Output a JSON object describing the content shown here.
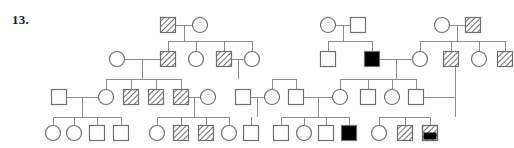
{
  "label": {
    "question_number": "13."
  },
  "legend": {
    "fill_types": [
      "unaffected",
      "hatched",
      "filled",
      "hatched-filled"
    ],
    "shapes": [
      "square",
      "circle"
    ],
    "shape_meaning": {
      "square": "male",
      "circle": "female"
    },
    "colors": {
      "stroke": "#6f6f6f",
      "line": "#8d8d8d",
      "filled": "#000000",
      "background": "#ffffff",
      "hatch": "#555555"
    }
  },
  "chart_data": {
    "type": "diagram",
    "diagram_type": "pedigree",
    "generations": 4,
    "symbol_size": 15,
    "generation_y": [
      25,
      59,
      97,
      133
    ],
    "individuals": [
      {
        "id": "I1",
        "gen": 1,
        "x": 168,
        "y": 25,
        "shape": "square",
        "fill": "hatched"
      },
      {
        "id": "I2",
        "gen": 1,
        "x": 200,
        "y": 25,
        "shape": "circle",
        "fill": "unaffected"
      },
      {
        "id": "I3",
        "gen": 1,
        "x": 328,
        "y": 25,
        "shape": "circle",
        "fill": "unaffected"
      },
      {
        "id": "I4",
        "gen": 1,
        "x": 358,
        "y": 25,
        "shape": "square",
        "fill": "unaffected"
      },
      {
        "id": "I5",
        "gen": 1,
        "x": 442,
        "y": 25,
        "shape": "circle",
        "fill": "unaffected"
      },
      {
        "id": "I6",
        "gen": 1,
        "x": 473,
        "y": 25,
        "shape": "square",
        "fill": "hatched"
      },
      {
        "id": "II1",
        "gen": 2,
        "x": 117,
        "y": 59,
        "shape": "circle",
        "fill": "unaffected"
      },
      {
        "id": "II2",
        "gen": 2,
        "x": 168,
        "y": 59,
        "shape": "square",
        "fill": "hatched"
      },
      {
        "id": "II3",
        "gen": 2,
        "x": 196,
        "y": 59,
        "shape": "circle",
        "fill": "unaffected"
      },
      {
        "id": "II4",
        "gen": 2,
        "x": 224,
        "y": 59,
        "shape": "square",
        "fill": "hatched"
      },
      {
        "id": "II5",
        "gen": 2,
        "x": 252,
        "y": 59,
        "shape": "circle",
        "fill": "unaffected"
      },
      {
        "id": "II6",
        "gen": 2,
        "x": 328,
        "y": 59,
        "shape": "square",
        "fill": "unaffected"
      },
      {
        "id": "II7",
        "gen": 2,
        "x": 372,
        "y": 59,
        "shape": "square",
        "fill": "filled"
      },
      {
        "id": "II8",
        "gen": 2,
        "x": 420,
        "y": 59,
        "shape": "circle",
        "fill": "unaffected"
      },
      {
        "id": "II9",
        "gen": 2,
        "x": 451,
        "y": 59,
        "shape": "square",
        "fill": "hatched"
      },
      {
        "id": "II10",
        "gen": 2,
        "x": 479,
        "y": 59,
        "shape": "circle",
        "fill": "unaffected"
      },
      {
        "id": "II11",
        "gen": 2,
        "x": 505,
        "y": 59,
        "shape": "square",
        "fill": "hatched"
      },
      {
        "id": "III1",
        "gen": 3,
        "x": 59,
        "y": 97,
        "shape": "square",
        "fill": "unaffected"
      },
      {
        "id": "III2",
        "gen": 3,
        "x": 106,
        "y": 97,
        "shape": "circle",
        "fill": "unaffected"
      },
      {
        "id": "III3",
        "gen": 3,
        "x": 131,
        "y": 97,
        "shape": "square",
        "fill": "hatched"
      },
      {
        "id": "III4",
        "gen": 3,
        "x": 156,
        "y": 97,
        "shape": "square",
        "fill": "hatched"
      },
      {
        "id": "III5",
        "gen": 3,
        "x": 181,
        "y": 97,
        "shape": "square",
        "fill": "hatched"
      },
      {
        "id": "III6",
        "gen": 3,
        "x": 208,
        "y": 97,
        "shape": "circle",
        "fill": "unaffected"
      },
      {
        "id": "III7",
        "gen": 3,
        "x": 243,
        "y": 97,
        "shape": "square",
        "fill": "unaffected"
      },
      {
        "id": "III8",
        "gen": 3,
        "x": 272,
        "y": 97,
        "shape": "circle",
        "fill": "unaffected"
      },
      {
        "id": "III9",
        "gen": 3,
        "x": 296,
        "y": 97,
        "shape": "square",
        "fill": "unaffected"
      },
      {
        "id": "III10",
        "gen": 3,
        "x": 340,
        "y": 97,
        "shape": "circle",
        "fill": "unaffected"
      },
      {
        "id": "III11",
        "gen": 3,
        "x": 368,
        "y": 97,
        "shape": "square",
        "fill": "unaffected"
      },
      {
        "id": "III12",
        "gen": 3,
        "x": 392,
        "y": 97,
        "shape": "circle",
        "fill": "unaffected"
      },
      {
        "id": "III13",
        "gen": 3,
        "x": 416,
        "y": 97,
        "shape": "square",
        "fill": "unaffected"
      },
      {
        "id": "IV1",
        "gen": 4,
        "x": 53,
        "y": 133,
        "shape": "circle",
        "fill": "unaffected"
      },
      {
        "id": "IV2",
        "gen": 4,
        "x": 74,
        "y": 133,
        "shape": "circle",
        "fill": "unaffected"
      },
      {
        "id": "IV3",
        "gen": 4,
        "x": 97,
        "y": 133,
        "shape": "square",
        "fill": "unaffected"
      },
      {
        "id": "IV4",
        "gen": 4,
        "x": 121,
        "y": 133,
        "shape": "square",
        "fill": "unaffected"
      },
      {
        "id": "IV5",
        "gen": 4,
        "x": 157,
        "y": 133,
        "shape": "circle",
        "fill": "unaffected"
      },
      {
        "id": "IV6",
        "gen": 4,
        "x": 181,
        "y": 133,
        "shape": "square",
        "fill": "hatched"
      },
      {
        "id": "IV7",
        "gen": 4,
        "x": 206,
        "y": 133,
        "shape": "square",
        "fill": "hatched"
      },
      {
        "id": "IV8",
        "gen": 4,
        "x": 229,
        "y": 133,
        "shape": "circle",
        "fill": "unaffected"
      },
      {
        "id": "IV9",
        "gen": 4,
        "x": 251,
        "y": 133,
        "shape": "square",
        "fill": "unaffected"
      },
      {
        "id": "IV10",
        "gen": 4,
        "x": 281,
        "y": 133,
        "shape": "square",
        "fill": "unaffected"
      },
      {
        "id": "IV11",
        "gen": 4,
        "x": 304,
        "y": 133,
        "shape": "circle",
        "fill": "unaffected"
      },
      {
        "id": "IV12",
        "gen": 4,
        "x": 326,
        "y": 133,
        "shape": "square",
        "fill": "unaffected"
      },
      {
        "id": "IV13",
        "gen": 4,
        "x": 349,
        "y": 133,
        "shape": "square",
        "fill": "filled"
      },
      {
        "id": "IV14",
        "gen": 4,
        "x": 379,
        "y": 133,
        "shape": "circle",
        "fill": "unaffected"
      },
      {
        "id": "IV15",
        "gen": 4,
        "x": 405,
        "y": 133,
        "shape": "square",
        "fill": "hatched"
      },
      {
        "id": "IV16",
        "gen": 4,
        "x": 430,
        "y": 133,
        "shape": "square",
        "fill": "hatched-filled"
      }
    ],
    "matings": [
      {
        "id": "M1",
        "partners": [
          "I1",
          "I2"
        ],
        "y": 25,
        "x1": 176,
        "x2": 192,
        "drop_x": 184,
        "sib_y": 41
      },
      {
        "id": "M2",
        "partners": [
          "I3",
          "I4"
        ],
        "y": 25,
        "x1": 336,
        "x2": 350,
        "drop_x": 343,
        "sib_y": 41
      },
      {
        "id": "M3",
        "partners": [
          "I5",
          "I6"
        ],
        "y": 25,
        "x1": 450,
        "x2": 465,
        "drop_x": 457,
        "sib_y": 41
      },
      {
        "id": "M4",
        "partners": [
          "II1",
          "II2"
        ],
        "y": 59,
        "x1": 125,
        "x2": 160,
        "drop_x": 142,
        "sib_y": 79
      },
      {
        "id": "M5",
        "partners": [
          "II4",
          "II5"
        ],
        "y": 59,
        "x1": 232,
        "x2": 244,
        "drop_x": 238,
        "sib_y": 79
      },
      {
        "id": "M6",
        "partners": [
          "II7",
          "II8"
        ],
        "y": 59,
        "x1": 380,
        "x2": 412,
        "drop_x": 396,
        "sib_y": 79
      },
      {
        "id": "M7",
        "partners": [
          "III1",
          "III2"
        ],
        "y": 97,
        "x1": 67,
        "x2": 98,
        "drop_x": 82,
        "sib_y": 117
      },
      {
        "id": "M8",
        "partners": [
          "III5",
          "III6"
        ],
        "y": 97,
        "x1": 189,
        "x2": 200,
        "drop_x": 194,
        "sib_y": 117
      },
      {
        "id": "M9",
        "partners": [
          "III7",
          "III8"
        ],
        "y": 97,
        "x1": 251,
        "x2": 264,
        "drop_x": 257,
        "sib_y": 117
      },
      {
        "id": "M10",
        "partners": [
          "III9",
          "III10"
        ],
        "y": 97,
        "x1": 304,
        "x2": 332,
        "drop_x": 318,
        "sib_y": 117
      },
      {
        "id": "M11",
        "partners": [
          "III13",
          "IV14"
        ],
        "y": 97,
        "x1": 424,
        "x2": 455,
        "drop_x": 455,
        "sib_y": 117
      }
    ],
    "sibships": [
      {
        "id": "S1",
        "parents": "M1",
        "sib_y": 41,
        "children": [
          "II2",
          "II3",
          "II4",
          "II5"
        ]
      },
      {
        "id": "S2",
        "parents": "M2",
        "sib_y": 41,
        "children": [
          "II6",
          "II7"
        ]
      },
      {
        "id": "S3",
        "parents": "M3",
        "sib_y": 41,
        "children": [
          "II8",
          "II9",
          "II10",
          "II11"
        ]
      },
      {
        "id": "S4",
        "parents": "M4",
        "sib_y": 79,
        "children": [
          "III2",
          "III3",
          "III4",
          "III5"
        ]
      },
      {
        "id": "S5",
        "parents": "M5",
        "sib_y": 79,
        "children": [
          "III8",
          "III9"
        ]
      },
      {
        "id": "S6",
        "parents": "M6",
        "sib_y": 79,
        "children": [
          "III10",
          "III11",
          "III12",
          "III13"
        ]
      },
      {
        "id": "S7",
        "parents": "M7",
        "sib_y": 117,
        "children": [
          "IV1",
          "IV2",
          "IV3",
          "IV4"
        ]
      },
      {
        "id": "S8",
        "parents": "M8",
        "sib_y": 117,
        "children": [
          "IV5",
          "IV6",
          "IV7",
          "IV8"
        ]
      },
      {
        "id": "S9",
        "parents": "M9",
        "sib_y": 117,
        "children": [
          "IV9"
        ]
      },
      {
        "id": "S10",
        "parents": "M10",
        "sib_y": 117,
        "children": [
          "IV10",
          "IV11",
          "IV12",
          "IV13"
        ]
      },
      {
        "id": "S11",
        "parents": "M11",
        "sib_y": 117,
        "children": [
          "IV14",
          "IV15",
          "IV16"
        ]
      }
    ],
    "counts": {
      "total_individuals": 47,
      "males": 26,
      "females": 21,
      "unaffected": 30,
      "hatched_carriers": 13,
      "filled_affected": 2,
      "hatched_filled": 1
    }
  }
}
